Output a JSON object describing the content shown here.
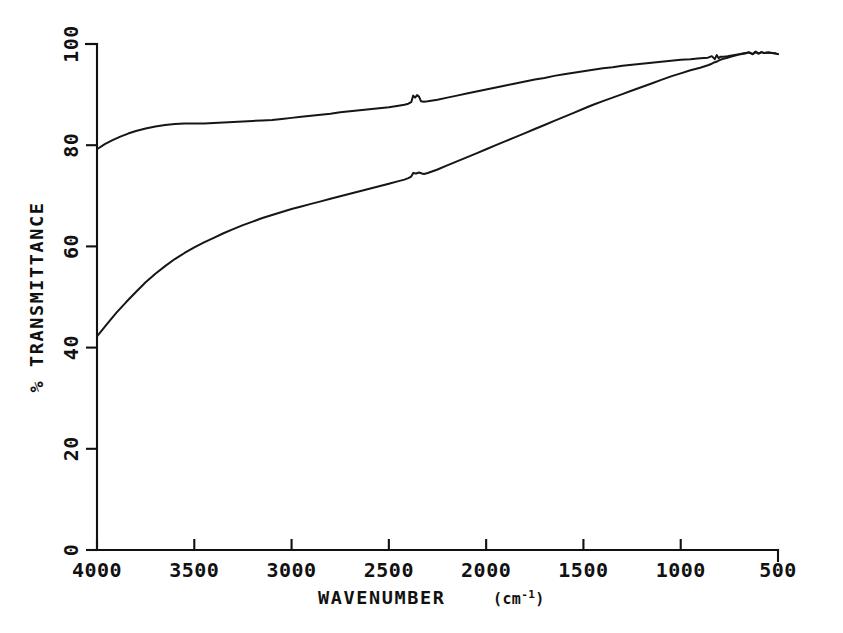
{
  "chart_data": {
    "type": "line",
    "title": "",
    "subtitle": "",
    "xlabel": "WAVENUMBER",
    "xlabel_unit": "(cm",
    "xlabel_unit_sup": "-1",
    "xlabel_unit_close": ")",
    "xlabel_full": "WAVENUMBER (cm-1)",
    "ylabel": "% TRANSMITTANCE",
    "xlim": [
      4000,
      500
    ],
    "ylim": [
      0,
      100
    ],
    "x_inverted": true,
    "grid": false,
    "legend": null,
    "legend_position": "none",
    "xticks": [
      {
        "value": 4000,
        "label": "4000"
      },
      {
        "value": 3500,
        "label": "3500"
      },
      {
        "value": 3000,
        "label": "3000"
      },
      {
        "value": 2500,
        "label": "2500"
      },
      {
        "value": 2000,
        "label": "2000"
      },
      {
        "value": 1500,
        "label": "1500"
      },
      {
        "value": 1000,
        "label": "1000"
      },
      {
        "value": 500,
        "label": "500"
      }
    ],
    "yticks": [
      {
        "value": 0,
        "label": "0"
      },
      {
        "value": 20,
        "label": "20"
      },
      {
        "value": 40,
        "label": "40"
      },
      {
        "value": 60,
        "label": "60"
      },
      {
        "value": 80,
        "label": "80"
      },
      {
        "value": 100,
        "label": "100"
      }
    ],
    "series": [
      {
        "name": "upper-trace",
        "color": "#15161a",
        "points": [
          [
            4000,
            79.2
          ],
          [
            3960,
            80.2
          ],
          [
            3920,
            81.0
          ],
          [
            3880,
            81.7
          ],
          [
            3840,
            82.3
          ],
          [
            3800,
            82.8
          ],
          [
            3750,
            83.3
          ],
          [
            3700,
            83.7
          ],
          [
            3650,
            84.0
          ],
          [
            3600,
            84.2
          ],
          [
            3550,
            84.3
          ],
          [
            3500,
            84.3
          ],
          [
            3450,
            84.3
          ],
          [
            3400,
            84.4
          ],
          [
            3350,
            84.5
          ],
          [
            3300,
            84.6
          ],
          [
            3250,
            84.7
          ],
          [
            3200,
            84.8
          ],
          [
            3150,
            84.9
          ],
          [
            3100,
            85.0
          ],
          [
            3050,
            85.2
          ],
          [
            3000,
            85.4
          ],
          [
            2950,
            85.6
          ],
          [
            2900,
            85.8
          ],
          [
            2850,
            86.0
          ],
          [
            2800,
            86.2
          ],
          [
            2750,
            86.5
          ],
          [
            2700,
            86.7
          ],
          [
            2650,
            86.9
          ],
          [
            2600,
            87.1
          ],
          [
            2550,
            87.3
          ],
          [
            2500,
            87.5
          ],
          [
            2450,
            87.8
          ],
          [
            2420,
            88.0
          ],
          [
            2400,
            88.2
          ],
          [
            2385,
            88.5
          ],
          [
            2375,
            89.8
          ],
          [
            2365,
            89.4
          ],
          [
            2355,
            89.9
          ],
          [
            2345,
            89.6
          ],
          [
            2335,
            88.7
          ],
          [
            2320,
            88.6
          ],
          [
            2300,
            88.7
          ],
          [
            2250,
            89.0
          ],
          [
            2200,
            89.4
          ],
          [
            2150,
            89.8
          ],
          [
            2100,
            90.2
          ],
          [
            2050,
            90.6
          ],
          [
            2000,
            91.0
          ],
          [
            1950,
            91.4
          ],
          [
            1900,
            91.8
          ],
          [
            1850,
            92.2
          ],
          [
            1800,
            92.6
          ],
          [
            1750,
            93.0
          ],
          [
            1700,
            93.3
          ],
          [
            1650,
            93.7
          ],
          [
            1600,
            94.0
          ],
          [
            1550,
            94.3
          ],
          [
            1500,
            94.6
          ],
          [
            1450,
            94.9
          ],
          [
            1400,
            95.2
          ],
          [
            1350,
            95.4
          ],
          [
            1300,
            95.7
          ],
          [
            1250,
            95.9
          ],
          [
            1200,
            96.1
          ],
          [
            1150,
            96.3
          ],
          [
            1100,
            96.5
          ],
          [
            1050,
            96.7
          ],
          [
            1000,
            96.9
          ],
          [
            950,
            97.0
          ],
          [
            900,
            97.2
          ],
          [
            860,
            97.3
          ],
          [
            840,
            97.6
          ],
          [
            825,
            97.0
          ],
          [
            815,
            97.8
          ],
          [
            805,
            97.2
          ],
          [
            795,
            97.5
          ],
          [
            780,
            97.5
          ],
          [
            760,
            97.6
          ],
          [
            730,
            97.8
          ],
          [
            700,
            98.0
          ],
          [
            670,
            98.2
          ],
          [
            650,
            98.4
          ],
          [
            630,
            98.0
          ],
          [
            615,
            98.5
          ],
          [
            600,
            98.1
          ],
          [
            585,
            98.4
          ],
          [
            570,
            98.2
          ],
          [
            550,
            98.3
          ],
          [
            530,
            98.2
          ],
          [
            510,
            98.1
          ],
          [
            500,
            98.0
          ]
        ]
      },
      {
        "name": "lower-trace",
        "color": "#15161a",
        "points": [
          [
            4000,
            42.2
          ],
          [
            3950,
            44.6
          ],
          [
            3900,
            46.9
          ],
          [
            3850,
            49.0
          ],
          [
            3800,
            51.0
          ],
          [
            3750,
            52.9
          ],
          [
            3700,
            54.6
          ],
          [
            3650,
            56.1
          ],
          [
            3600,
            57.5
          ],
          [
            3550,
            58.7
          ],
          [
            3500,
            59.8
          ],
          [
            3450,
            60.8
          ],
          [
            3400,
            61.7
          ],
          [
            3350,
            62.6
          ],
          [
            3300,
            63.4
          ],
          [
            3250,
            64.2
          ],
          [
            3200,
            64.9
          ],
          [
            3150,
            65.6
          ],
          [
            3100,
            66.2
          ],
          [
            3050,
            66.8
          ],
          [
            3000,
            67.4
          ],
          [
            2950,
            67.9
          ],
          [
            2900,
            68.4
          ],
          [
            2850,
            68.9
          ],
          [
            2800,
            69.4
          ],
          [
            2750,
            69.9
          ],
          [
            2700,
            70.4
          ],
          [
            2650,
            70.9
          ],
          [
            2600,
            71.4
          ],
          [
            2550,
            71.9
          ],
          [
            2500,
            72.4
          ],
          [
            2450,
            72.9
          ],
          [
            2420,
            73.2
          ],
          [
            2400,
            73.5
          ],
          [
            2385,
            73.8
          ],
          [
            2375,
            74.5
          ],
          [
            2360,
            74.4
          ],
          [
            2345,
            74.6
          ],
          [
            2330,
            74.4
          ],
          [
            2320,
            74.3
          ],
          [
            2300,
            74.5
          ],
          [
            2250,
            75.2
          ],
          [
            2200,
            76.0
          ],
          [
            2150,
            76.8
          ],
          [
            2100,
            77.6
          ],
          [
            2050,
            78.4
          ],
          [
            2000,
            79.2
          ],
          [
            1950,
            80.0
          ],
          [
            1900,
            80.8
          ],
          [
            1850,
            81.6
          ],
          [
            1800,
            82.4
          ],
          [
            1750,
            83.2
          ],
          [
            1700,
            84.0
          ],
          [
            1650,
            84.8
          ],
          [
            1600,
            85.6
          ],
          [
            1550,
            86.4
          ],
          [
            1500,
            87.2
          ],
          [
            1450,
            88.0
          ],
          [
            1400,
            88.7
          ],
          [
            1350,
            89.4
          ],
          [
            1300,
            90.1
          ],
          [
            1250,
            90.8
          ],
          [
            1200,
            91.5
          ],
          [
            1150,
            92.2
          ],
          [
            1100,
            92.9
          ],
          [
            1050,
            93.6
          ],
          [
            1000,
            94.2
          ],
          [
            950,
            94.8
          ],
          [
            900,
            95.3
          ],
          [
            860,
            95.8
          ],
          [
            840,
            96.1
          ],
          [
            825,
            96.4
          ],
          [
            810,
            96.6
          ],
          [
            795,
            96.9
          ],
          [
            780,
            97.1
          ],
          [
            760,
            97.3
          ],
          [
            730,
            97.6
          ],
          [
            700,
            97.9
          ],
          [
            670,
            98.1
          ],
          [
            650,
            98.3
          ],
          [
            630,
            98.0
          ],
          [
            615,
            98.4
          ],
          [
            600,
            98.1
          ],
          [
            585,
            98.4
          ],
          [
            570,
            98.2
          ],
          [
            550,
            98.3
          ],
          [
            530,
            98.2
          ],
          [
            510,
            98.1
          ],
          [
            500,
            98.0
          ]
        ]
      }
    ],
    "annotations": [
      {
        "name": "co2-notch-upper",
        "x": 2360,
        "y": 89.7,
        "note": "sharp CO2 doublet artifact on upper trace"
      },
      {
        "name": "co2-step-lower",
        "x": 2360,
        "y": 74.5,
        "note": "small CO2 step on lower trace"
      },
      {
        "name": "noise-spikes-right",
        "x": 700,
        "y": 97.8,
        "note": "noise spikes near detector cutoff"
      }
    ]
  },
  "geometry": {
    "plot_left": 97,
    "plot_right": 778,
    "plot_top": 44,
    "plot_bottom": 550
  }
}
